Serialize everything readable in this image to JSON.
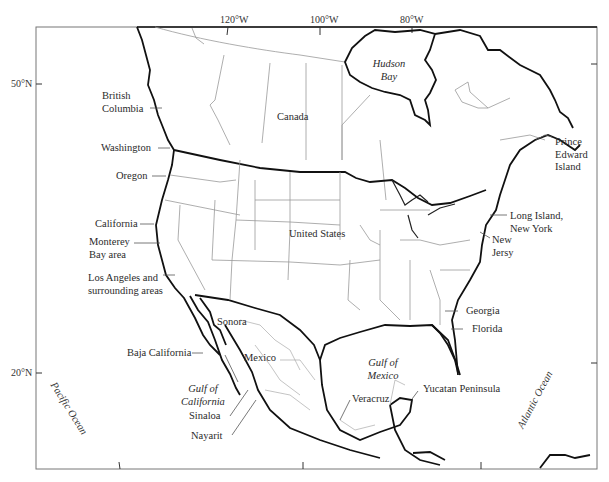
{
  "map": {
    "longitude_ticks": [
      "120°W",
      "100°W",
      "80°W"
    ],
    "latitude_ticks": [
      "50°N",
      "20°N"
    ],
    "countries": {
      "canada": "Canada",
      "united_states": "United States",
      "mexico": "Mexico"
    },
    "water_bodies": {
      "hudson_bay_1": "Hudson",
      "hudson_bay_2": "Bay",
      "gulf_mexico_1": "Gulf of",
      "gulf_mexico_2": "Mexico",
      "gulf_california_1": "Gulf of",
      "gulf_california_2": "California",
      "pacific": "Pacific Ocean",
      "atlantic": "Atlantic Ocean"
    },
    "regions_west": {
      "british_columbia_1": "British",
      "british_columbia_2": "Columbia",
      "washington": "Washington",
      "oregon": "Oregon",
      "california": "California",
      "monterey_1": "Monterey",
      "monterey_2": "Bay area",
      "la_1": "Los Angeles and",
      "la_2": "surrounding areas",
      "sonora": "Sonora",
      "baja": "Baja California",
      "sinaloa": "Sinaloa",
      "nayarit": "Nayarit"
    },
    "regions_east": {
      "pei_1": "Prince",
      "pei_2": "Edward",
      "pei_3": "Island",
      "long_island_1": "Long Island,",
      "long_island_2": "New York",
      "new_jersey_1": "New",
      "new_jersey_2": "Jersy",
      "georgia": "Georgia",
      "florida": "Florida",
      "veracruz": "Veracruz",
      "yucatan": "Yucatan Peninsula"
    }
  }
}
